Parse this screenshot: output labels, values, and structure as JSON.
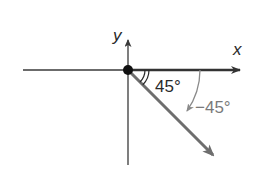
{
  "diagram": {
    "type": "angle-on-coordinate-plane",
    "axes": {
      "x_label": "x",
      "y_label": "y"
    },
    "angles": [
      {
        "label": "45°",
        "description": "reference angle between positive x-axis and terminal side"
      },
      {
        "label": "−45°",
        "description": "directed angle measured clockwise from positive x-axis"
      }
    ],
    "colors": {
      "axis": "#3a3a3a",
      "initial_side": "#333333",
      "terminal_side": "#6e6e6e",
      "directed_arc": "#8a8a8a",
      "vertex": "#111111",
      "text": "#2a2a2a"
    }
  }
}
